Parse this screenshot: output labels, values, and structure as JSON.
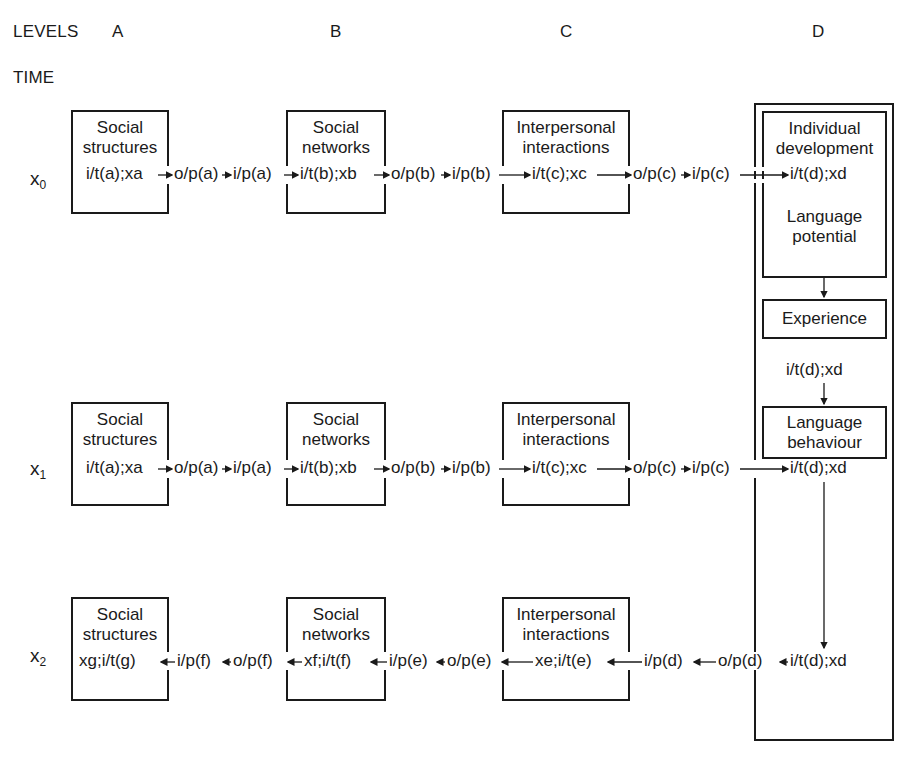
{
  "levels": {
    "label": "LEVELS",
    "items": [
      "A",
      "B",
      "C",
      "D"
    ]
  },
  "time": {
    "label": "TIME",
    "rows": [
      "x",
      "x",
      "x"
    ],
    "subscripts": [
      "0",
      "1",
      "2"
    ]
  },
  "boxes": {
    "A": "Social\nstructures",
    "B": "Social\nnetworks",
    "C": "Interpersonal\ninteractions",
    "D_dev": "Individual\ndevelopment",
    "D_potential": "Language\npotential",
    "D_experience": "Experience",
    "D_behaviour": "Language\nbehaviour"
  },
  "row0": {
    "a_in": "i/t(a);xa",
    "a_out": "o/p(a)",
    "a_pass": "i/p(a)",
    "b_in": "i/t(b);xb",
    "b_out": "o/p(b)",
    "b_pass": "i/p(b)",
    "c_in": "i/t(c);xc",
    "c_out": "o/p(c)",
    "c_pass": "i/p(c)",
    "d_in": "i/t(d);xd"
  },
  "d_mid": "i/t(d);xd",
  "row1": {
    "a_in": "i/t(a);xa",
    "a_out": "o/p(a)",
    "a_pass": "i/p(a)",
    "b_in": "i/t(b);xb",
    "b_out": "o/p(b)",
    "b_pass": "i/p(b)",
    "c_in": "i/t(c);xc",
    "c_out": "o/p(c)",
    "c_pass": "i/p(c)",
    "d_in": "i/t(d);xd"
  },
  "row2": {
    "a_in": "xg;i/t(g)",
    "a_pass": "i/p(f)",
    "b_out": "o/p(f)",
    "b_in": "xf;i/t(f)",
    "b_pass": "i/p(e)",
    "c_out": "o/p(e)",
    "c_in": "xe;i/t(e)",
    "c_pass": "i/p(d)",
    "d_out": "o/p(d)",
    "d_in": "i/t(d);xd"
  }
}
